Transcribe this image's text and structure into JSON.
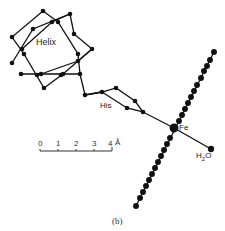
{
  "figure": {
    "caption": "(b)",
    "labels": {
      "helix": "Helix",
      "his": "His",
      "fe": "Fe",
      "water": "H",
      "water_sub": "2",
      "water_o": "O"
    },
    "scale_bar": {
      "ticks": [
        "0",
        "1",
        "2",
        "3",
        "4"
      ],
      "unit": "Å"
    },
    "colors": {
      "ink": "#111111",
      "background": "#ffffff"
    }
  }
}
